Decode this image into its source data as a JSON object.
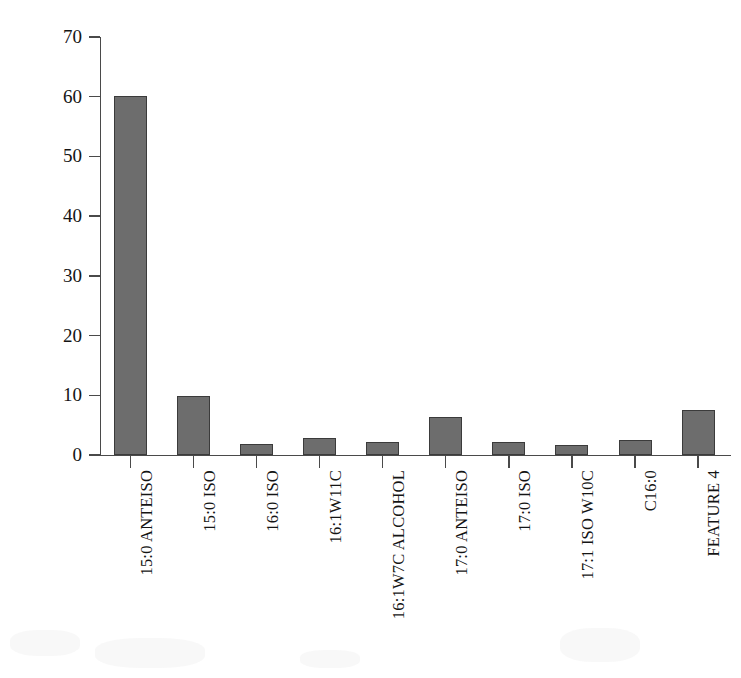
{
  "chart_data": {
    "type": "bar",
    "title": "",
    "xlabel": "",
    "ylabel": "脂肪酸含量/%",
    "ylabel_text": "脂肪酸含量",
    "ylabel_unit": "/%",
    "ylim": [
      0,
      70
    ],
    "ytick_step": 10,
    "yticks": [
      0,
      10,
      20,
      30,
      40,
      50,
      60,
      70
    ],
    "ytick_labels": [
      "0",
      "10",
      "20",
      "30",
      "40",
      "50",
      "60",
      "70"
    ],
    "grid": false,
    "legend": null,
    "categories": [
      "15:0 ANTEISO",
      "15:0 ISO",
      "16:0 ISO",
      "16:1W11C",
      "16:1W7C ALCOHOL",
      "17:0 ANTEISO",
      "17:0 ISO",
      "17:1 ISO W10C",
      "C16:0",
      "FEATURE 4"
    ],
    "values": [
      60.2,
      9.9,
      1.8,
      2.8,
      2.2,
      6.4,
      2.2,
      1.7,
      2.5,
      7.6
    ],
    "bar_color": "#6d6d6d",
    "bar_edge_color": "#3b3b3b",
    "axis_color": "#4a4a4a",
    "background_color": "#ffffff"
  }
}
